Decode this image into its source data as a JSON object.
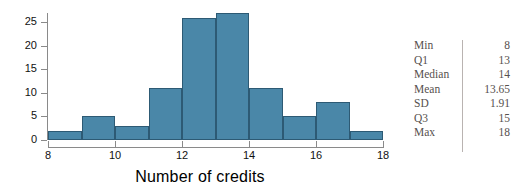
{
  "chart_data": {
    "type": "bar",
    "title": "",
    "xlabel": "Number of credits",
    "ylabel": "",
    "xlim": [
      8,
      18
    ],
    "ylim": [
      0,
      27
    ],
    "grid": false,
    "legend": "none",
    "bin_width": 1,
    "bin_starts": [
      8,
      9,
      10,
      11,
      12,
      13,
      14,
      15,
      16,
      17
    ],
    "bin_labels": [
      "8-9",
      "9-10",
      "10-11",
      "11-12",
      "12-13",
      "13-14",
      "14-15",
      "15-16",
      "16-17",
      "17-18"
    ],
    "values": [
      2,
      5,
      3,
      11,
      26,
      27,
      11,
      5,
      8,
      2
    ],
    "bar_color": "#4a87a8",
    "bar_edge_color": "#2d5a74",
    "x_ticks": [
      8,
      10,
      12,
      14,
      16,
      18
    ],
    "x_tick_labels": [
      "8",
      "10",
      "12",
      "14",
      "16",
      "18"
    ],
    "y_ticks": [
      0,
      5,
      10,
      15,
      20,
      25
    ],
    "y_tick_labels": [
      "0",
      "5",
      "10",
      "15",
      "20",
      "25"
    ]
  },
  "summary_table": {
    "rows": [
      {
        "label": "Min",
        "value": "8"
      },
      {
        "label": "Q1",
        "value": "13"
      },
      {
        "label": "Median",
        "value": "14"
      },
      {
        "label": "Mean",
        "value": "13.65"
      },
      {
        "label": "SD",
        "value": "1.91"
      },
      {
        "label": "Q3",
        "value": "15"
      },
      {
        "label": "Max",
        "value": "18"
      }
    ]
  },
  "colors": {
    "background": "#ffffff",
    "bar_fill": "#4a87a8",
    "bar_edge": "#2d5a74",
    "axis": "#8a8a8a",
    "axis_text": "#111111",
    "table_text": "#56504e",
    "table_divider": "#b9b3b1"
  }
}
